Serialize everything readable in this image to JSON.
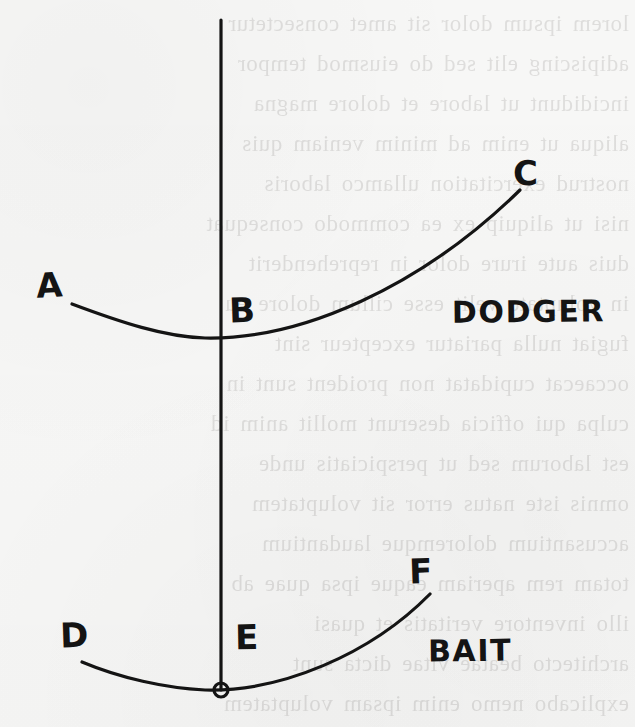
{
  "figure": {
    "kind": "hand-drawn-diagram",
    "medium": "ink on paper",
    "background_color": "#f7f7f6",
    "ink_color": "#141414",
    "width": 635,
    "height": 727
  },
  "axis": {
    "name": "vertical-axis-line",
    "x": 221,
    "y_top": 20,
    "y_bottom": 690,
    "stroke_width": 3.2,
    "origin_marker": {
      "name": "origin-circle",
      "cx": 221,
      "cy": 690,
      "r": 7,
      "stroke_width": 3.2
    }
  },
  "curves": [
    {
      "name": "dodger-curve",
      "label": "DODGER",
      "start_point": "A",
      "axis_point": "B",
      "end_point": "C",
      "path": "M 72 304 C 120 322, 165 337, 205 338 C 300 340, 420 288, 520 190",
      "stroke_width": 3.2
    },
    {
      "name": "bait-curve",
      "label": "BAIT",
      "start_point": "D",
      "axis_point": "E",
      "end_point": "F",
      "path": "M 82 662 C 120 678, 165 688, 205 690 C 280 692, 370 655, 430 594",
      "stroke_width": 3.2
    }
  ],
  "labels": {
    "a": "A",
    "b": "B",
    "c": "C",
    "d": "D",
    "e": "E",
    "f": "F",
    "dodger": "DODGER",
    "bait": "BAIT"
  },
  "bleed_through_text": "lorem ipsum dolor sit amet consectetur\nadipiscing elit sed do eiusmod tempor\nincididunt ut labore et dolore magna\naliqua ut enim ad minim veniam quis\nnostrud exercitation ullamco laboris\nnisi ut aliquip ex ea commodo consequat\nduis aute irure dolor in reprehenderit\nin voluptate velit esse cillum dolore eu\nfugiat nulla pariatur excepteur sint\noccaecat cupidatat non proident sunt in\nculpa qui officia deserunt mollit anim id\nest laborum sed ut perspiciatis unde\nomnis iste natus error sit voluptatem\naccusantium doloremque laudantium\ntotam rem aperiam eaque ipsa quae ab\nillo inventore veritatis et quasi\narchitecto beatae vitae dicta sunt\nexplicabo nemo enim ipsam voluptatem"
}
